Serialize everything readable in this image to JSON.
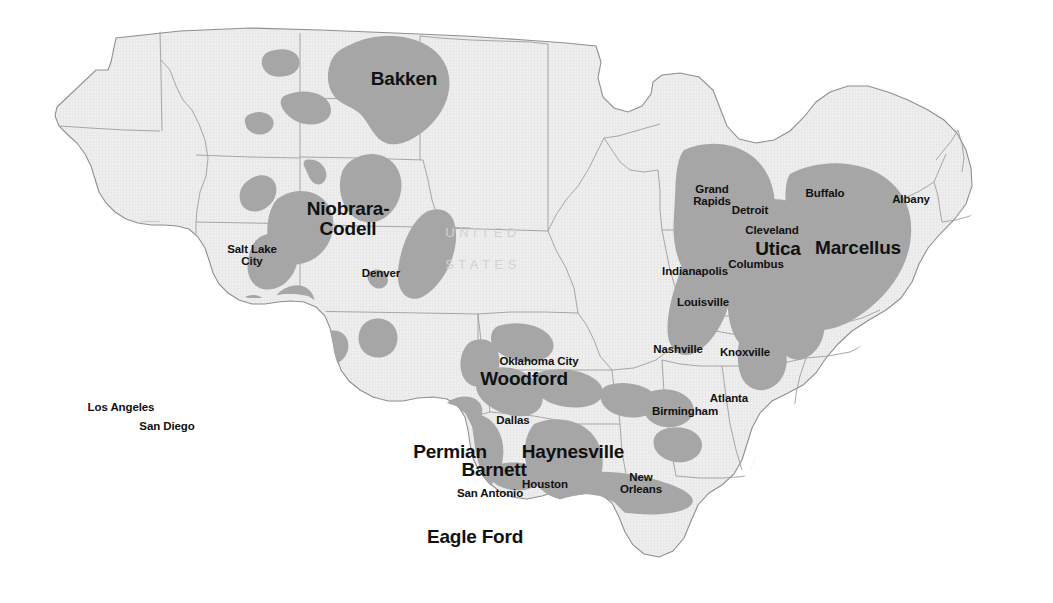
{
  "map": {
    "title": "United States Shale Plays",
    "colors": {
      "background": "#ffffff",
      "land_fill": "#eeeeee",
      "state_border": "#9a9a9a",
      "country_border": "#8a8a8a",
      "shale_fill": "#a6a6a6",
      "label_text": "#111111",
      "watermark_text": "#d2d2d2"
    },
    "country_watermark": [
      {
        "text": "UNITED",
        "x": 483,
        "y": 233
      },
      {
        "text": "STATES",
        "x": 483,
        "y": 265
      }
    ],
    "shale_plays": [
      {
        "name": "Bakken",
        "x": 404,
        "y": 79,
        "lines": [
          "Bakken"
        ]
      },
      {
        "name": "Niobrara-Codell",
        "x": 348,
        "y": 219,
        "lines": [
          "Niobrara-",
          "Codell"
        ]
      },
      {
        "name": "Woodford",
        "x": 524,
        "y": 379,
        "lines": [
          "Woodford"
        ]
      },
      {
        "name": "Permian",
        "x": 450,
        "y": 452,
        "lines": [
          "Permian"
        ]
      },
      {
        "name": "Barnett",
        "x": 494,
        "y": 470,
        "lines": [
          "Barnett"
        ]
      },
      {
        "name": "Haynesville",
        "x": 573,
        "y": 452,
        "lines": [
          "Haynesville"
        ]
      },
      {
        "name": "Eagle Ford",
        "x": 475,
        "y": 537,
        "lines": [
          "Eagle Ford"
        ]
      },
      {
        "name": "Utica",
        "x": 778,
        "y": 249,
        "lines": [
          "Utica"
        ]
      },
      {
        "name": "Marcellus",
        "x": 858,
        "y": 248,
        "lines": [
          "Marcellus"
        ]
      }
    ],
    "cities": [
      {
        "name": "Salt Lake City",
        "x": 252,
        "y": 255,
        "lines": [
          "Salt Lake",
          "City"
        ]
      },
      {
        "name": "Denver",
        "x": 381,
        "y": 274,
        "lines": [
          "Denver"
        ]
      },
      {
        "name": "Los Angeles",
        "x": 121,
        "y": 408,
        "lines": [
          "Los Angeles"
        ]
      },
      {
        "name": "San Diego",
        "x": 167,
        "y": 427,
        "lines": [
          "San Diego"
        ]
      },
      {
        "name": "Oklahoma City",
        "x": 539,
        "y": 362,
        "lines": [
          "Oklahoma City"
        ]
      },
      {
        "name": "Dallas",
        "x": 513,
        "y": 421,
        "lines": [
          "Dallas"
        ]
      },
      {
        "name": "San Antonio",
        "x": 490,
        "y": 494,
        "lines": [
          "San Antonio"
        ]
      },
      {
        "name": "Houston",
        "x": 545,
        "y": 485,
        "lines": [
          "Houston"
        ]
      },
      {
        "name": "New Orleans",
        "x": 641,
        "y": 483,
        "lines": [
          "New",
          "Orleans"
        ]
      },
      {
        "name": "Birmingham",
        "x": 685,
        "y": 412,
        "lines": [
          "Birmingham"
        ]
      },
      {
        "name": "Atlanta",
        "x": 729,
        "y": 399,
        "lines": [
          "Atlanta"
        ]
      },
      {
        "name": "Nashville",
        "x": 678,
        "y": 350,
        "lines": [
          "Nashville"
        ]
      },
      {
        "name": "Knoxville",
        "x": 745,
        "y": 353,
        "lines": [
          "Knoxville"
        ]
      },
      {
        "name": "Louisville",
        "x": 703,
        "y": 303,
        "lines": [
          "Louisville"
        ]
      },
      {
        "name": "Indianapolis",
        "x": 695,
        "y": 272,
        "lines": [
          "Indianapolis"
        ]
      },
      {
        "name": "Columbus",
        "x": 756,
        "y": 265,
        "lines": [
          "Columbus"
        ]
      },
      {
        "name": "Cleveland",
        "x": 772,
        "y": 231,
        "lines": [
          "Cleveland"
        ]
      },
      {
        "name": "Detroit",
        "x": 750,
        "y": 211,
        "lines": [
          "Detroit"
        ]
      },
      {
        "name": "Grand Rapids",
        "x": 712,
        "y": 195,
        "lines": [
          "Grand",
          "Rapids"
        ]
      },
      {
        "name": "Buffalo",
        "x": 825,
        "y": 194,
        "lines": [
          "Buffalo"
        ]
      },
      {
        "name": "Albany",
        "x": 911,
        "y": 200,
        "lines": [
          "Albany"
        ]
      }
    ]
  }
}
